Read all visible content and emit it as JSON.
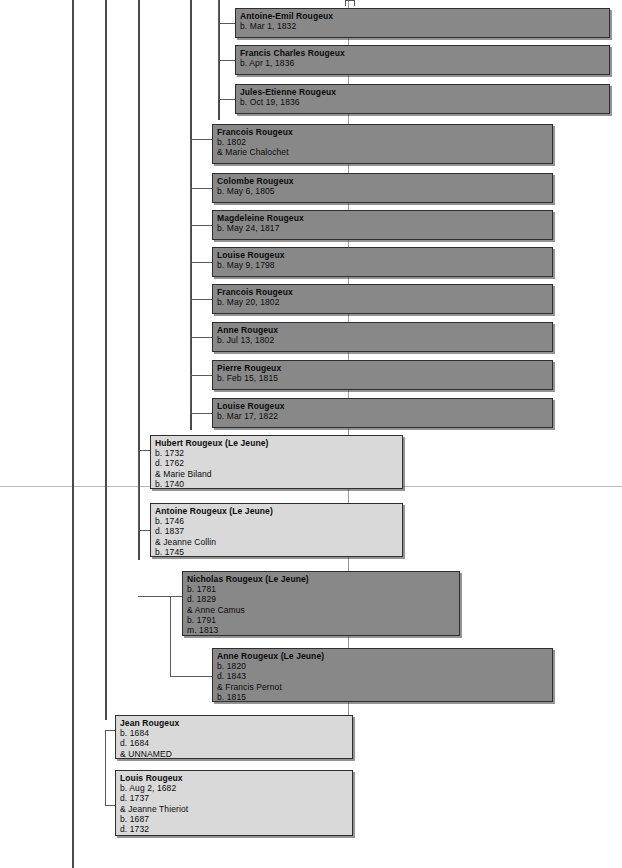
{
  "chart": {
    "width": 622,
    "height": 868,
    "colors": {
      "dark_node_fill": "#888888",
      "light_node_fill": "#d9d9d9",
      "node_border": "#2c2c2c",
      "trunk_line": "#4a4a4a",
      "connector_line": "#5a5a5a",
      "page_guide": "#b9b9b9",
      "background": "#ffffff"
    }
  },
  "trunks": [
    {
      "name": "trunk-1",
      "x": 72,
      "y": 0,
      "height": 868
    },
    {
      "name": "trunk-2",
      "x": 105,
      "y": 0,
      "height": 720
    },
    {
      "name": "trunk-3",
      "x": 138,
      "y": 0,
      "height": 560
    },
    {
      "name": "trunk-4",
      "x": 190,
      "y": 0,
      "height": 430
    },
    {
      "name": "trunk-5",
      "x": 218,
      "y": 0,
      "height": 120
    }
  ],
  "page_guides": [
    {
      "name": "page-guide-horizontal",
      "y": 486
    }
  ],
  "nodes": [
    {
      "id": "antoine-emil-rougeux",
      "style": "dark",
      "x": 235,
      "y": 8,
      "width": 375,
      "height": 30,
      "lines": [
        "Antoine-Emil Rougeux",
        "b. Mar 1, 1832"
      ]
    },
    {
      "id": "francis-charles-rougeux",
      "style": "dark",
      "x": 235,
      "y": 45,
      "width": 375,
      "height": 30,
      "lines": [
        "Francis Charles Rougeux",
        "b. Apr 1, 1836"
      ]
    },
    {
      "id": "jules-etienne-rougeux",
      "style": "dark",
      "x": 235,
      "y": 84,
      "width": 375,
      "height": 30,
      "lines": [
        "Jules-Etienne Rougeux",
        "b. Oct 19, 1836"
      ]
    },
    {
      "id": "francois-rougeux-1802",
      "style": "dark",
      "x": 212,
      "y": 124,
      "width": 341,
      "height": 40,
      "lines": [
        "Francois Rougeux",
        "b. 1802",
        "& Marie Chalochet"
      ]
    },
    {
      "id": "colombe-rougeux",
      "style": "dark",
      "x": 212,
      "y": 173,
      "width": 341,
      "height": 30,
      "lines": [
        "Colombe Rougeux",
        "b. May 6, 1805"
      ]
    },
    {
      "id": "magdeleine-rougeux",
      "style": "dark",
      "x": 212,
      "y": 210,
      "width": 341,
      "height": 30,
      "lines": [
        "Magdeleine Rougeux",
        "b. May 24, 1817"
      ]
    },
    {
      "id": "louise-rougeux-1798",
      "style": "dark",
      "x": 212,
      "y": 247,
      "width": 341,
      "height": 30,
      "lines": [
        "Louise Rougeux",
        "b. May 9, 1798"
      ]
    },
    {
      "id": "francois-rougeux-1802b",
      "style": "dark",
      "x": 212,
      "y": 284,
      "width": 341,
      "height": 30,
      "lines": [
        "Francois Rougeux",
        "b. May 20, 1802"
      ]
    },
    {
      "id": "anne-rougeux-1802",
      "style": "dark",
      "x": 212,
      "y": 322,
      "width": 341,
      "height": 30,
      "lines": [
        "Anne Rougeux",
        "b. Jul 13, 1802"
      ]
    },
    {
      "id": "pierre-rougeux-1815",
      "style": "dark",
      "x": 212,
      "y": 360,
      "width": 341,
      "height": 30,
      "lines": [
        "Pierre Rougeux",
        "b. Feb 15, 1815"
      ]
    },
    {
      "id": "louise-rougeux-1822",
      "style": "dark",
      "x": 212,
      "y": 398,
      "width": 341,
      "height": 30,
      "lines": [
        "Louise Rougeux",
        "b. Mar 17, 1822"
      ]
    },
    {
      "id": "hubert-rougeux-le-jeune",
      "style": "light",
      "x": 150,
      "y": 435,
      "width": 253,
      "height": 54,
      "lines": [
        "Hubert Rougeux (Le Jeune)",
        "b. 1732",
        "d. 1762",
        "& Marie Biland",
        "b. 1740"
      ]
    },
    {
      "id": "antoine-rougeux-le-jeune",
      "style": "light",
      "x": 150,
      "y": 503,
      "width": 253,
      "height": 54,
      "lines": [
        "Antoine Rougeux (Le Jeune)",
        "b. 1746",
        "d. 1837",
        "& Jeanne Collin",
        "b. 1745"
      ]
    },
    {
      "id": "nicholas-rougeux-le-jeune",
      "style": "dark",
      "x": 182,
      "y": 571,
      "width": 278,
      "height": 65,
      "lines": [
        "Nicholas Rougeux (Le Jeune)",
        "b. 1781",
        "d. 1829",
        "& Anne Camus",
        "b. 1791",
        "m. 1813"
      ]
    },
    {
      "id": "anne-rougeux-le-jeune",
      "style": "dark",
      "x": 212,
      "y": 648,
      "width": 341,
      "height": 54,
      "lines": [
        "Anne Rougeux (Le Jeune)",
        "b. 1820",
        "d. 1843",
        "& Francis Pernot",
        "b. 1815"
      ]
    },
    {
      "id": "jean-rougeux",
      "style": "light",
      "x": 115,
      "y": 715,
      "width": 238,
      "height": 44,
      "lines": [
        "Jean Rougeux",
        "b. 1684",
        "d. 1684",
        "& UNNAMED"
      ]
    },
    {
      "id": "louis-rougeux",
      "style": "light",
      "x": 115,
      "y": 770,
      "width": 238,
      "height": 66,
      "lines": [
        "Louis Rougeux",
        "b. Aug 2, 1682",
        "d. 1737",
        "& Jeanne Thieriot",
        "b. 1687",
        "d. 1732",
        "m. 1711"
      ]
    }
  ],
  "connectors": {
    "vertical": [
      {
        "name": "sibling-spine-group-a",
        "x": 218,
        "y": 0,
        "height": 100
      },
      {
        "name": "sibling-spine-group-b",
        "x": 190,
        "y": 139,
        "height": 275
      },
      {
        "name": "sibling-spine-group-c",
        "x": 138,
        "y": 450,
        "height": 80
      },
      {
        "name": "sibling-spine-group-d",
        "x": 170,
        "y": 596,
        "height": 80
      },
      {
        "name": "sibling-spine-group-e",
        "x": 105,
        "y": 730,
        "height": 75
      }
    ],
    "horizontal": [
      {
        "name": "stub-antoine-emil",
        "x": 218,
        "y": 23,
        "width": 17
      },
      {
        "name": "stub-francis-charles",
        "x": 218,
        "y": 60,
        "width": 17
      },
      {
        "name": "stub-jules-etienne",
        "x": 218,
        "y": 99,
        "width": 17
      },
      {
        "name": "stub-francois-1802",
        "x": 190,
        "y": 139,
        "width": 22
      },
      {
        "name": "stub-colombe",
        "x": 190,
        "y": 188,
        "width": 22
      },
      {
        "name": "stub-magdeleine",
        "x": 190,
        "y": 225,
        "width": 22
      },
      {
        "name": "stub-louise-1798",
        "x": 190,
        "y": 262,
        "width": 22
      },
      {
        "name": "stub-francois-1802b",
        "x": 190,
        "y": 299,
        "width": 22
      },
      {
        "name": "stub-anne-1802",
        "x": 190,
        "y": 337,
        "width": 22
      },
      {
        "name": "stub-pierre-1815",
        "x": 190,
        "y": 375,
        "width": 22
      },
      {
        "name": "stub-louise-1822",
        "x": 190,
        "y": 413,
        "width": 22
      },
      {
        "name": "stub-hubert",
        "x": 138,
        "y": 450,
        "width": 12
      },
      {
        "name": "stub-antoine",
        "x": 138,
        "y": 530,
        "width": 12
      },
      {
        "name": "stub-nicholas",
        "x": 138,
        "y": 596,
        "width": 44
      },
      {
        "name": "stub-anne-le-jeune",
        "x": 170,
        "y": 676,
        "width": 42
      },
      {
        "name": "stub-jean",
        "x": 105,
        "y": 730,
        "width": 10
      },
      {
        "name": "stub-louis",
        "x": 105,
        "y": 805,
        "width": 10
      }
    ],
    "drops": [
      {
        "name": "drop-descendant-main",
        "x": 348,
        "y": 0,
        "height": 435
      },
      {
        "name": "drop-descendant-mid",
        "x": 348,
        "y": 489,
        "height": 82
      },
      {
        "name": "drop-descendant-lower",
        "x": 348,
        "y": 636,
        "height": 12
      },
      {
        "name": "drop-descendant-bottom",
        "x": 348,
        "y": 702,
        "height": 13
      }
    ],
    "top_stub": {
      "name": "top-stub-marker",
      "x": 345,
      "y": 0,
      "width": 8,
      "height": 5
    }
  }
}
